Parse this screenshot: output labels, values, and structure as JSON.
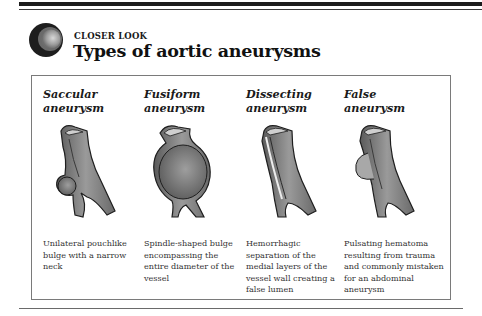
{
  "header": {
    "kicker": "CLOSER LOOK",
    "title": "Types of aortic aneurysms"
  },
  "colors": {
    "rule": "#1c1c1c",
    "panel_border": "#7a7a7a",
    "vessel_fill": "#8c8c8c",
    "vessel_shadow": "#5a5a5a",
    "vessel_light": "#c8c8c8"
  },
  "types": [
    {
      "name": "Saccular\naneurysm",
      "illustration": "saccular-vessel-illustration",
      "description": "Unilateral pouchlike bulge with a narrow neck"
    },
    {
      "name": "Fusiform\naneurysm",
      "illustration": "fusiform-vessel-illustration",
      "description": "Spindle-shaped bulge encompassing the entire diameter of the vessel"
    },
    {
      "name": "Dissecting\naneurysm",
      "illustration": "dissecting-vessel-illustration",
      "description": "Hemorrhagic separation of the medial layers of the vessel wall creating a false lumen"
    },
    {
      "name": "False\naneurysm",
      "illustration": "false-vessel-illustration",
      "description": "Pulsating hematoma resulting from trauma and commonly mistaken for an abdominal aneurysm"
    }
  ]
}
